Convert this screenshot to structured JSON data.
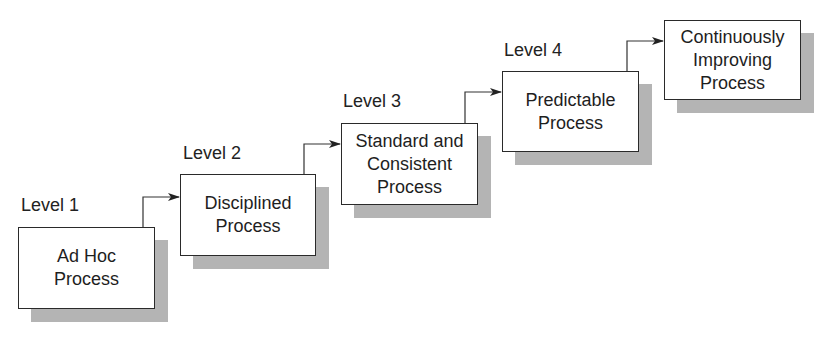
{
  "diagram": {
    "levels": [
      {
        "label": "Level 1",
        "lines": [
          "Ad Hoc",
          "Process"
        ],
        "box": {
          "x": 18,
          "y": 227,
          "w": 137,
          "h": 82
        }
      },
      {
        "label": "Level 2",
        "lines": [
          "Disciplined",
          "Process"
        ],
        "box": {
          "x": 180,
          "y": 174,
          "w": 136,
          "h": 82
        }
      },
      {
        "label": "Level 3",
        "lines": [
          "Standard and",
          "Consistent",
          "Process"
        ],
        "box": {
          "x": 341,
          "y": 123,
          "w": 137,
          "h": 82
        }
      },
      {
        "label": "Level 4",
        "lines": [
          "Predictable",
          "Process"
        ],
        "box": {
          "x": 502,
          "y": 71,
          "w": 137,
          "h": 81
        }
      },
      {
        "label": "",
        "lines": [
          "Continuously",
          "Improving",
          "Process"
        ],
        "box": {
          "x": 664,
          "y": 20,
          "w": 137,
          "h": 80
        }
      }
    ],
    "shadow_offset": 13,
    "colors": {
      "shadow": "#b4b4b4",
      "border": "#2a2a2a",
      "text": "#1e1e1e"
    }
  }
}
